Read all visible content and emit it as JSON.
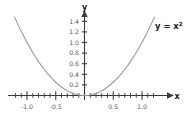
{
  "chart_data": {
    "type": "line",
    "title": "",
    "subtitle": "",
    "xlabel": "x",
    "ylabel": "y",
    "equation_label": "y = x",
    "equation_exponent": "2",
    "function": "y = x^2",
    "xlim": [
      -1.25,
      1.25
    ],
    "ylim": [
      0,
      1.55
    ],
    "grid": false,
    "legend": "none",
    "axis_style": "cartesian-arrows",
    "x_ticks_major": [
      -1.0,
      -0.5,
      0.5,
      1.0
    ],
    "x_ticklabels": [
      "-1.0",
      "-0.5",
      "0.5",
      "1.0"
    ],
    "x_ticks_minor": [
      -1.2,
      -1.1,
      -0.9,
      -0.8,
      -0.7,
      -0.6,
      -0.4,
      -0.3,
      -0.2,
      -0.1,
      0.1,
      0.2,
      0.3,
      0.4,
      0.6,
      0.7,
      0.8,
      0.9,
      1.1,
      1.2
    ],
    "y_ticks_major": [
      0.2,
      0.4,
      0.6,
      0.8,
      1.0,
      1.2,
      1.4
    ],
    "y_ticklabels": [
      "0.2",
      "0.4",
      "0.6",
      "0.8",
      "1.0",
      "1.2",
      "1.4"
    ],
    "series": [
      {
        "name": "y = x^2",
        "color": "#9a9a9a",
        "x": [
          -1.22,
          -1.15,
          -1.1,
          -1.05,
          -1.0,
          -0.95,
          -0.9,
          -0.85,
          -0.8,
          -0.75,
          -0.7,
          -0.65,
          -0.6,
          -0.55,
          -0.5,
          -0.45,
          -0.4,
          -0.35,
          -0.3,
          -0.25,
          -0.2,
          -0.15,
          -0.1,
          -0.05,
          0.0,
          0.05,
          0.1,
          0.15,
          0.2,
          0.25,
          0.3,
          0.35,
          0.4,
          0.45,
          0.5,
          0.55,
          0.6,
          0.65,
          0.7,
          0.75,
          0.8,
          0.85,
          0.9,
          0.95,
          1.0,
          1.05,
          1.1,
          1.15,
          1.22
        ],
        "y": [
          1.488,
          1.323,
          1.21,
          1.103,
          1.0,
          0.903,
          0.81,
          0.723,
          0.64,
          0.563,
          0.49,
          0.423,
          0.36,
          0.303,
          0.25,
          0.203,
          0.16,
          0.123,
          0.09,
          0.063,
          0.04,
          0.023,
          0.01,
          0.003,
          0.0,
          0.003,
          0.01,
          0.023,
          0.04,
          0.063,
          0.09,
          0.123,
          0.16,
          0.203,
          0.25,
          0.303,
          0.36,
          0.423,
          0.49,
          0.563,
          0.64,
          0.723,
          0.81,
          0.903,
          1.0,
          1.103,
          1.21,
          1.323,
          1.488
        ]
      }
    ],
    "colors": {
      "background": "#ffffff",
      "axis": "#3a3a3a",
      "curve": "#9a9a9a",
      "ticklabel": "#5a5a5a",
      "axisname": "#1a1a1a"
    }
  }
}
